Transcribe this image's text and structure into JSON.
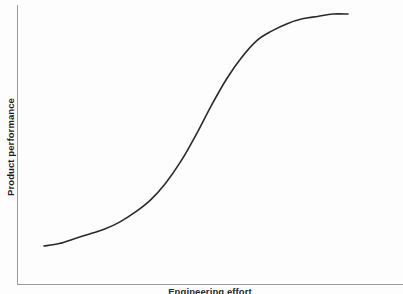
{
  "figure": {
    "background_color": "#fdfdfd",
    "axis_color": "#9a9a9a",
    "curve_color": "#2a2a2a"
  },
  "axes": {
    "y_label": "Product performance",
    "x_label": "Engineering effort"
  },
  "chart_data": {
    "type": "line",
    "title": "",
    "subtitle": "",
    "xlabel": "Engineering effort",
    "ylabel": "Product performance",
    "xlim": [
      0,
      100
    ],
    "ylim": [
      0,
      100
    ],
    "grid": false,
    "legend": null,
    "axis_ticks": {
      "x": [],
      "y": []
    },
    "annotations": [],
    "series": [
      {
        "name": "Technology S-curve",
        "shape": "sigmoid",
        "color": "#2a2a2a",
        "line_width": 1.6,
        "x": [
          0,
          5,
          10,
          15,
          20,
          25,
          30,
          35,
          40,
          45,
          50,
          55,
          60,
          65,
          70,
          75,
          80,
          85,
          90,
          95,
          100
        ],
        "values": [
          2,
          3,
          5,
          7,
          9,
          12,
          16,
          21,
          28,
          37,
          48,
          60,
          71,
          80,
          87,
          91,
          94,
          96,
          97,
          98,
          98
        ]
      }
    ]
  }
}
